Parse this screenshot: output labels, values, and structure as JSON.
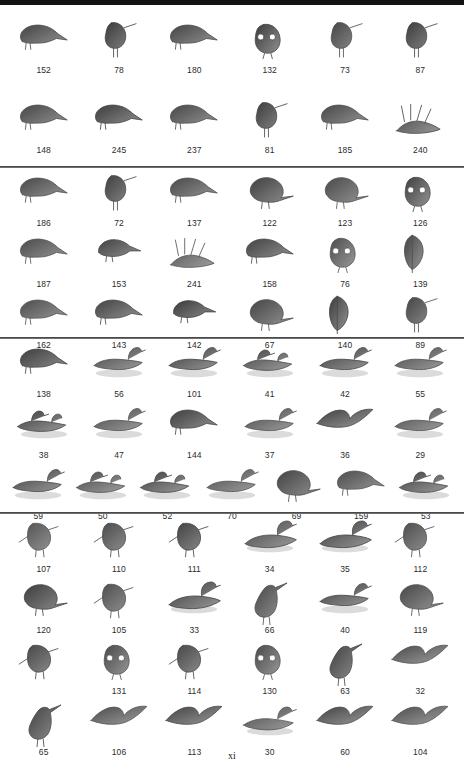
{
  "page": {
    "page_number": "xi",
    "background_color": "#ffffff",
    "divider_color": "#6e6e6e",
    "top_bar_color": "#121212",
    "caption_color": "#2b2b2b"
  },
  "sections": [
    {
      "id": "section-1",
      "rows": [
        {
          "id": "section-1-row-1",
          "items": [
            {
              "label": "152",
              "icon": "bird-perched-flycatcher-figure"
            },
            {
              "label": "78",
              "icon": "bird-standing-sandpiper-figure"
            },
            {
              "label": "180",
              "icon": "bird-perched-sparrow-figure"
            },
            {
              "label": "132",
              "icon": "bird-owl-figure"
            },
            {
              "label": "73",
              "icon": "bird-plover-figure"
            },
            {
              "label": "87",
              "icon": "bird-dowitcher-figure"
            }
          ]
        },
        {
          "id": "section-1-row-2",
          "items": [
            {
              "label": "148",
              "icon": "bird-perched-kingbird-figure"
            },
            {
              "label": "245",
              "icon": "bird-perched-warbler-figure"
            },
            {
              "label": "237",
              "icon": "bird-perched-blackbird-figure"
            },
            {
              "label": "81",
              "icon": "bird-turnstone-figure"
            },
            {
              "label": "185",
              "icon": "bird-thrush-figure"
            },
            {
              "label": "240",
              "icon": "bird-in-grass-figure"
            }
          ]
        }
      ]
    },
    {
      "id": "section-2",
      "rows": [
        {
          "id": "section-2-row-1",
          "items": [
            {
              "label": "186",
              "icon": "bird-perched-vireo-figure"
            },
            {
              "label": "72",
              "icon": "bird-golden-plover-figure"
            },
            {
              "label": "137",
              "icon": "bird-kingfisher-figure"
            },
            {
              "label": "122",
              "icon": "bird-pigeon-figure"
            },
            {
              "label": "123",
              "icon": "bird-dove-figure"
            },
            {
              "label": "126",
              "icon": "bird-barn-owl-figure"
            }
          ]
        },
        {
          "id": "section-2-row-2",
          "items": [
            {
              "label": "187",
              "icon": "bird-perched-flycatcher-branch-figure"
            },
            {
              "label": "153",
              "icon": "bird-shrike-figure"
            },
            {
              "label": "241",
              "icon": "bird-in-reeds-figure"
            },
            {
              "label": "158",
              "icon": "bird-jay-figure"
            },
            {
              "label": "76",
              "icon": "bird-yellowlegs-figure"
            },
            {
              "label": "139",
              "icon": "bird-woodpecker-trunk-figure"
            }
          ]
        },
        {
          "id": "section-2-row-3",
          "items": [
            {
              "label": "162",
              "icon": "bird-swallow-pair-figure"
            },
            {
              "label": "143",
              "icon": "bird-perched-lark-figure"
            },
            {
              "label": "142",
              "icon": "bird-small-woodpecker-figure"
            },
            {
              "label": "67",
              "icon": "bird-rail-figure"
            },
            {
              "label": "140",
              "icon": "bird-woodpecker-vertical-figure"
            },
            {
              "label": "89",
              "icon": "bird-snipe-figure"
            }
          ]
        }
      ]
    },
    {
      "id": "section-3",
      "rows": [
        {
          "id": "section-3-row-1",
          "items": [
            {
              "label": "138",
              "icon": "bird-woodpecker-dark-figure"
            },
            {
              "label": "56",
              "icon": "duck-swimming-bufflehead-figure"
            },
            {
              "label": "101",
              "icon": "bird-tern-figure"
            },
            {
              "label": "41",
              "icon": "duck-pair-swimming-figure"
            },
            {
              "label": "42",
              "icon": "duck-swimming-teal-figure"
            },
            {
              "label": "55",
              "icon": "duck-swimming-goldeneye-figure"
            }
          ]
        },
        {
          "id": "section-3-row-2",
          "items": [
            {
              "label": "38",
              "icon": "duck-pair-water-figure"
            },
            {
              "label": "47",
              "icon": "duck-swimming-mallard-figure"
            },
            {
              "label": "144",
              "icon": "bird-woodpecker-side-figure"
            },
            {
              "label": "37",
              "icon": "duck-swimming-gadwall-figure"
            },
            {
              "label": "36",
              "icon": "duck-flying-figure"
            },
            {
              "label": "29",
              "icon": "goose-swimming-figure"
            }
          ]
        },
        {
          "id": "section-3-row-3",
          "items": [
            {
              "label": "59",
              "icon": "duck-swimming-scoter-figure"
            },
            {
              "label": "50",
              "icon": "duck-pair-dark-figure"
            },
            {
              "label": "52",
              "icon": "duck-pair-scaup-figure"
            },
            {
              "label": "70",
              "icon": "duck-small-swimming-figure"
            },
            {
              "label": "69",
              "icon": "bird-gallinule-figure"
            },
            {
              "label": "159",
              "icon": "bird-perched-crow-figure"
            },
            {
              "label": "53",
              "icon": "duck-pair-merganser-figure"
            }
          ]
        }
      ]
    },
    {
      "id": "section-4",
      "rows": [
        {
          "id": "section-4-row-1",
          "items": [
            {
              "label": "107",
              "icon": "hawk-perched-branch-figure"
            },
            {
              "label": "110",
              "icon": "hawk-perched-figure"
            },
            {
              "label": "111",
              "icon": "hawk-perched-post-figure"
            },
            {
              "label": "34",
              "icon": "swan-swimming-figure"
            },
            {
              "label": "35",
              "icon": "swan-swimming-pale-figure"
            },
            {
              "label": "112",
              "icon": "hawk-perched-branch-2-figure"
            }
          ]
        },
        {
          "id": "section-4-row-2",
          "items": [
            {
              "label": "120",
              "icon": "bird-grouse-figure"
            },
            {
              "label": "105",
              "icon": "hawk-landing-figure"
            },
            {
              "label": "33",
              "icon": "swan-white-figure"
            },
            {
              "label": "66",
              "icon": "heron-night-figure"
            },
            {
              "label": "40",
              "icon": "duck-landing-figure"
            },
            {
              "label": "119",
              "icon": "bird-pheasant-figure"
            }
          ]
        },
        {
          "id": "section-4-row-3",
          "items": [
            {
              "label": "",
              "icon": "osprey-perched-figure"
            },
            {
              "label": "131",
              "icon": "owl-short-eared-figure"
            },
            {
              "label": "114",
              "icon": "hawk-dark-perched-figure"
            },
            {
              "label": "130",
              "icon": "owl-long-eared-figure"
            },
            {
              "label": "63",
              "icon": "heron-standing-figure"
            },
            {
              "label": "32",
              "icon": "goose-flying-figure"
            }
          ]
        },
        {
          "id": "section-4-row-4",
          "items": [
            {
              "label": "65",
              "icon": "heron-green-figure"
            },
            {
              "label": "106",
              "icon": "hawk-wings-spread-figure"
            },
            {
              "label": "113",
              "icon": "hawk-flying-figure"
            },
            {
              "label": "30",
              "icon": "grebe-swimming-figure"
            },
            {
              "label": "60",
              "icon": "cormorant-wings-figure"
            },
            {
              "label": "104",
              "icon": "vulture-soaring-figure"
            }
          ]
        }
      ]
    }
  ]
}
